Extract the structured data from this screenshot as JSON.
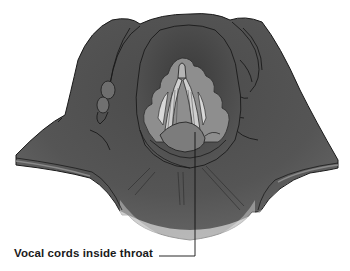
{
  "figure": {
    "colors": {
      "tissue_dark": "#3f3f3f",
      "tissue_mid": "#5a5a5a",
      "tissue_light": "#8a8a8a",
      "folds": "#9a9a9a",
      "cords": "#c4c4c4",
      "outline": "#1a1a1a",
      "background": "#ffffff"
    }
  },
  "annotations": [
    {
      "text": "Vocal cords inside throat"
    }
  ]
}
